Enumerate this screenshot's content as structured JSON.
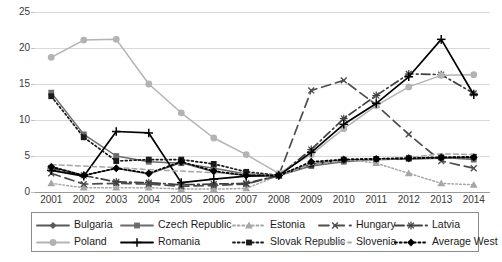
{
  "chart_data": {
    "type": "line",
    "title": "",
    "subtitle": "",
    "xlabel": "",
    "ylabel": "",
    "grid": true,
    "legend_position": "bottom",
    "ylim": [
      0,
      25
    ],
    "yticks": [
      0,
      5,
      10,
      15,
      20,
      25
    ],
    "categories": [
      "2001",
      "2002",
      "2003",
      "2004",
      "2005",
      "2006",
      "2007",
      "2008",
      "2009",
      "2010",
      "2011",
      "2012",
      "2013",
      "2014"
    ],
    "series": [
      {
        "name": "Bulgaria",
        "color": "#595959",
        "marker": "diamond",
        "dash": "solid",
        "values": [
          3.5,
          2.3,
          3.3,
          2.5,
          4.1,
          2.8,
          2.3,
          2.3,
          3.9,
          4.4,
          4.5,
          4.6,
          4.7,
          4.8
        ]
      },
      {
        "name": "Czech Republic",
        "color": "#6b6b6b",
        "marker": "square",
        "dash": "solid",
        "values": [
          13.8,
          8.0,
          5.0,
          4.2,
          4.0,
          3.3,
          2.5,
          2.3,
          3.6,
          4.2,
          4.5,
          4.6,
          4.8,
          4.5
        ]
      },
      {
        "name": "Estonia",
        "color": "#a6a6a6",
        "marker": "triangle",
        "dash": "dotted",
        "values": [
          1.2,
          0.6,
          0.6,
          0.6,
          0.4,
          0.4,
          0.5,
          2.3,
          4.1,
          4.6,
          4.0,
          2.6,
          1.2,
          1.0
        ]
      },
      {
        "name": "Hungary",
        "color": "#4d4d4d",
        "marker": "x",
        "dash": "longdash",
        "values": [
          2.6,
          1.1,
          1.2,
          1.1,
          0.8,
          0.9,
          1.1,
          2.3,
          14.1,
          15.5,
          12.1,
          8.0,
          4.3,
          3.3
        ]
      },
      {
        "name": "Latvia",
        "color": "#404040",
        "marker": "star",
        "dash": "dashdot",
        "values": [
          3.3,
          2.3,
          1.4,
          1.3,
          1.0,
          1.1,
          1.2,
          2.3,
          5.9,
          10.2,
          13.4,
          16.4,
          16.3,
          13.7
        ]
      },
      {
        "name": "Poland",
        "color": "#b3b3b3",
        "marker": "circle",
        "dash": "solid",
        "values": [
          18.7,
          21.1,
          21.2,
          15.0,
          11.0,
          7.5,
          5.2,
          2.6,
          5.2,
          8.8,
          12.0,
          14.6,
          16.2,
          16.3
        ]
      },
      {
        "name": "Romania",
        "color": "#000000",
        "marker": "plus",
        "dash": "solid",
        "values": [
          3.0,
          2.2,
          8.4,
          8.2,
          1.3,
          1.8,
          2.2,
          2.3,
          5.5,
          9.4,
          12.3,
          16.0,
          21.2,
          13.5
        ]
      },
      {
        "name": "Slovak Republic",
        "color": "#1a1a1a",
        "marker": "square",
        "dash": "dotted",
        "values": [
          13.3,
          7.6,
          4.3,
          4.5,
          4.5,
          3.9,
          2.8,
          2.3,
          3.8,
          4.5,
          4.6,
          4.7,
          4.8,
          4.9
        ]
      },
      {
        "name": "Slovenia",
        "color": "#a6a6a6",
        "marker": "none",
        "dash": "dashed",
        "values": [
          3.8,
          3.6,
          3.4,
          3.1,
          2.9,
          2.7,
          2.5,
          2.3,
          3.8,
          4.4,
          4.5,
          4.8,
          5.3,
          5.2
        ]
      },
      {
        "name": "Average West",
        "color": "#000000",
        "marker": "filled-diamond",
        "dash": "dotted",
        "values": [
          3.5,
          2.3,
          3.3,
          2.6,
          4.2,
          2.9,
          2.3,
          2.3,
          4.2,
          4.5,
          4.6,
          4.7,
          4.8,
          4.8
        ]
      }
    ]
  },
  "legend": {
    "rows": [
      [
        {
          "label": "Bulgaria",
          "key": "Bulgaria"
        },
        {
          "label": "Czech Republic",
          "key": "Czech Republic"
        },
        {
          "label": "Estonia",
          "key": "Estonia"
        },
        {
          "label": "Hungary",
          "key": "Hungary"
        },
        {
          "label": "Latvia",
          "key": "Latvia"
        }
      ],
      [
        {
          "label": "Poland",
          "key": "Poland"
        },
        {
          "label": "Romania",
          "key": "Romania"
        },
        {
          "label": "Slovak Republic",
          "key": "Slovak Republic"
        },
        {
          "label": "Slovenia",
          "key": "Slovenia"
        },
        {
          "label": "Average West",
          "key": "Average West"
        }
      ]
    ]
  }
}
